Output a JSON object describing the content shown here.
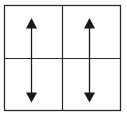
{
  "diagram": {
    "type": "grid-with-arrows",
    "grid": {
      "rows": 2,
      "columns": 2,
      "outer_box": {
        "x": 4,
        "y": 5,
        "width": 117,
        "height": 106
      },
      "vertical_divider_x": 62,
      "horizontal_divider_y": 58,
      "line_color": "#2a2a2a"
    },
    "arrows": [
      {
        "name": "left-double-arrow",
        "direction": "vertical-bidirectional",
        "x": 31,
        "y_top": 18,
        "y_bottom": 102
      },
      {
        "name": "right-double-arrow",
        "direction": "vertical-bidirectional",
        "x": 89,
        "y_top": 18,
        "y_bottom": 102
      }
    ],
    "arrow_color": "#1a1a1a"
  }
}
